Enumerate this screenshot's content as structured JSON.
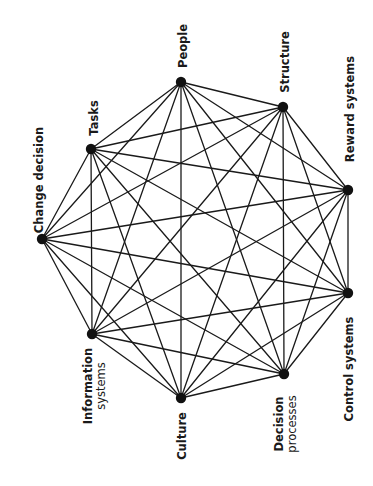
{
  "diagram": {
    "type": "complete-graph",
    "line_color": "#1a1a1a",
    "node_color": "#111111",
    "background": "#ffffff",
    "nodes": [
      {
        "id": "change-decision",
        "label": [
          "Change decision"
        ],
        "x": 42,
        "y": 239,
        "label_x": 39,
        "label_y": 180
      },
      {
        "id": "tasks",
        "label": [
          "Tasks"
        ],
        "x": 91,
        "y": 149,
        "label_x": 94,
        "label_y": 118
      },
      {
        "id": "people",
        "label": [
          "People"
        ],
        "x": 181,
        "y": 82,
        "label_x": 183,
        "label_y": 46
      },
      {
        "id": "structure",
        "label": [
          "Structure"
        ],
        "x": 283,
        "y": 107,
        "label_x": 285,
        "label_y": 62
      },
      {
        "id": "reward-systems",
        "label": [
          "Reward systems"
        ],
        "x": 348,
        "y": 190,
        "label_x": 350,
        "label_y": 109
      },
      {
        "id": "control-systems",
        "label": [
          "Control systems"
        ],
        "x": 348,
        "y": 293,
        "label_x": 349,
        "label_y": 369
      },
      {
        "id": "decision-processes",
        "label": [
          "Decision",
          "processes"
        ],
        "x": 284,
        "y": 374,
        "label_x": 285,
        "label_y": 424
      },
      {
        "id": "culture",
        "label": [
          "Culture"
        ],
        "x": 181,
        "y": 398,
        "label_x": 182,
        "label_y": 436
      },
      {
        "id": "information-systems",
        "label": [
          "Information",
          "systems"
        ],
        "x": 92,
        "y": 334,
        "label_x": 94,
        "label_y": 386
      }
    ]
  }
}
